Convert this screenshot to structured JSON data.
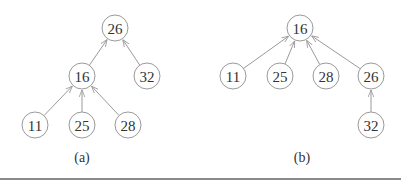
{
  "figure": {
    "style": {
      "node_stroke": "#9a9a9a",
      "edge_stroke": "#9a9a9a",
      "text_color": "#333333",
      "node_radius": 13
    },
    "trees": [
      {
        "caption": "(a)",
        "caption_pos": [
          82,
          157
        ],
        "nodes": [
          {
            "id": "a26",
            "label": "26",
            "x": 115,
            "y": 28
          },
          {
            "id": "a16",
            "label": "16",
            "x": 82,
            "y": 76
          },
          {
            "id": "a32",
            "label": "32",
            "x": 147,
            "y": 76
          },
          {
            "id": "a11",
            "label": "11",
            "x": 35,
            "y": 125
          },
          {
            "id": "a25",
            "label": "25",
            "x": 82,
            "y": 125
          },
          {
            "id": "a28",
            "label": "28",
            "x": 128,
            "y": 125
          }
        ],
        "edges": [
          {
            "from": "a16",
            "to": "a26"
          },
          {
            "from": "a32",
            "to": "a26"
          },
          {
            "from": "a11",
            "to": "a16"
          },
          {
            "from": "a25",
            "to": "a16"
          },
          {
            "from": "a28",
            "to": "a16"
          }
        ]
      },
      {
        "caption": "(b)",
        "caption_pos": [
          302,
          157
        ],
        "nodes": [
          {
            "id": "b16",
            "label": "16",
            "x": 300,
            "y": 28
          },
          {
            "id": "b11",
            "label": "11",
            "x": 233,
            "y": 76
          },
          {
            "id": "b25",
            "label": "25",
            "x": 280,
            "y": 76
          },
          {
            "id": "b28",
            "label": "28",
            "x": 326,
            "y": 76
          },
          {
            "id": "b26",
            "label": "26",
            "x": 371,
            "y": 76
          },
          {
            "id": "b32",
            "label": "32",
            "x": 371,
            "y": 125
          }
        ],
        "edges": [
          {
            "from": "b11",
            "to": "b16"
          },
          {
            "from": "b25",
            "to": "b16"
          },
          {
            "from": "b28",
            "to": "b16"
          },
          {
            "from": "b26",
            "to": "b16"
          },
          {
            "from": "b32",
            "to": "b26"
          }
        ]
      }
    ]
  }
}
